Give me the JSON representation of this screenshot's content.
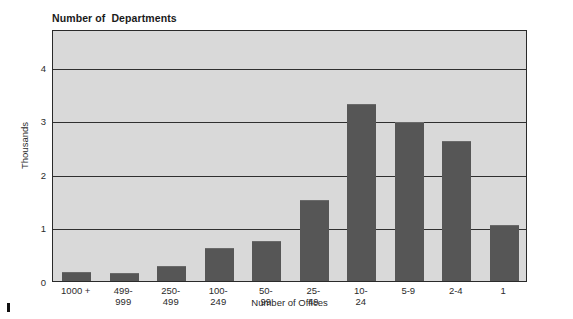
{
  "chart_data": {
    "type": "bar",
    "title": "Number of  Departments",
    "xlabel": "Number of Offices",
    "ylabel": "Thousands",
    "categories": [
      "1000 +",
      "499-\n999",
      "250-\n499",
      "100-\n249",
      "50-\n99",
      "25-\n49",
      "10-\n24",
      "5-9",
      "2-4",
      "1"
    ],
    "values": [
      0.17,
      0.15,
      0.28,
      0.62,
      0.75,
      1.52,
      3.3,
      2.97,
      2.62,
      1.05
    ],
    "ylim": [
      0,
      4.7
    ],
    "yticks": [
      0,
      1,
      2,
      3,
      4
    ],
    "ytick_labels": [
      "0",
      "1",
      "2",
      "3",
      "4"
    ],
    "grid": true,
    "legend": false,
    "bar_color": "#565656",
    "plot_background": "#d9d9d9",
    "axis_color": "#2a2a2a"
  }
}
